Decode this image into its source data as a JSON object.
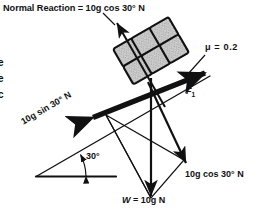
{
  "figure": {
    "background_color": "#ffffff",
    "ink_color": "#111111",
    "block_fill_color": "#c9c9c9",
    "incline_angle_deg": 30
  },
  "labels": {
    "normal_reaction": "Normal Reaction = 10g cos 30° N",
    "friction_coefficient": "μ = 0.2",
    "friction_force": "F",
    "friction_force_subscript": "1",
    "weight_prefix": "W",
    "weight_value": " = 10g N",
    "weight_full": "W = 10g N",
    "cos_component": "10g cos 30° N",
    "sin_component": "10g sin 30° N",
    "angle": "30°"
  },
  "edge_fragments": [
    "e",
    "e",
    "c"
  ],
  "vectors": [
    {
      "name": "normal-reaction",
      "label": "Normal Reaction = 10g cos 30° N",
      "direction": "up-left perpendicular to incline",
      "magnitude_expression": "10g cos 30° N"
    },
    {
      "name": "friction-force",
      "label": "F1",
      "direction": "up the incline",
      "magnitude_expression": "F1"
    },
    {
      "name": "weight",
      "label": "W = 10g N",
      "direction": "vertically downward",
      "magnitude_expression": "10g N"
    },
    {
      "name": "weight-component-parallel",
      "label": "10g sin 30° N",
      "direction": "down the incline",
      "magnitude_expression": "10g sin 30° N"
    },
    {
      "name": "weight-component-perpendicular",
      "label": "10g cos 30° N",
      "direction": "perpendicular into the incline",
      "magnitude_expression": "10g cos 30° N"
    }
  ]
}
